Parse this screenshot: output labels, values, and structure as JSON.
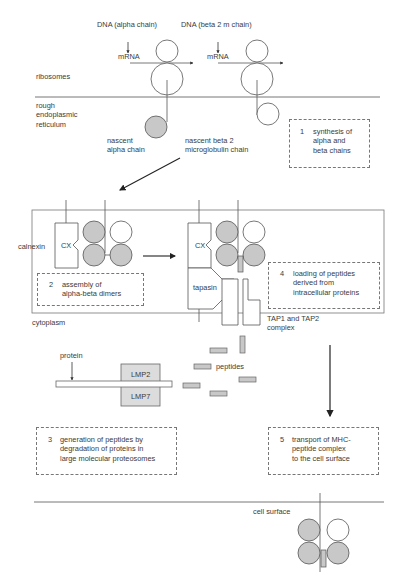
{
  "labels": {
    "dna_alpha": "DNA (alpha chain)",
    "dna_beta": "DNA (beta 2 m chain)",
    "mrna_1": "mRNA",
    "mrna_2": "mRNA",
    "ribosomes": "ribosomes",
    "rer": "rough\nendoplasmic\nreticulum",
    "nascent_alpha": "nascent\nalpha chain",
    "nascent_beta": "nascent beta 2\nmicroglobulin chain",
    "calnexin": "calnexin",
    "cx_1": "CX",
    "cx_2": "CX",
    "tapasin": "tapasin",
    "cytoplasm": "cytoplasm",
    "tap_complex": "TAP1 and TAP2\ncomplex",
    "protein": "protein",
    "lmp2": "LMP2",
    "lmp7": "LMP7",
    "peptides": "peptides",
    "cell_surface": "cell surface"
  },
  "steps": [
    {
      "num": "1",
      "text": "synthesis of\nalpha and\nbeta chains"
    },
    {
      "num": "2",
      "text": "assembly of\nalpha-beta dimers"
    },
    {
      "num": "3",
      "text": "generation of peptides by\ndegradation of proteins in\nlarge molecular proteosomes"
    },
    {
      "num": "4",
      "text": "loading of peptides\nderived from\nintracellular proteins"
    },
    {
      "num": "5",
      "text": "transport of MHC-\npeptide complex\nto the cell surface"
    }
  ],
  "colors": {
    "filled_subunit": "#c8c8c8",
    "outline": "#555555",
    "membrane": "#666666"
  }
}
